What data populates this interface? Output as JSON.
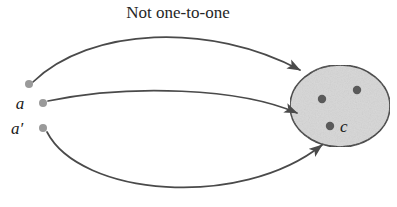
{
  "figure": {
    "title": "Not one-to-one",
    "width": 397,
    "height": 207,
    "background_color": "#ffffff"
  },
  "colors": {
    "title_text": "#262626",
    "label_text": "#1a1a1a",
    "curve_stroke": "#4a4a4a",
    "ellipse_stroke": "#333333",
    "ellipse_fill": "#d6d6d6",
    "domain_dot": "#9a9a9a",
    "codomain_dot": "#5a5a5a"
  },
  "domain_points": [
    {
      "id": "point-top",
      "label": "",
      "cx": 29,
      "cy": 84,
      "r": 4
    },
    {
      "id": "point-a",
      "label": "a",
      "cx": 43,
      "cy": 103,
      "r": 4,
      "label_x": 20,
      "label_y": 109
    },
    {
      "id": "point-a-prime",
      "label": "a′",
      "cx": 43,
      "cy": 128,
      "r": 4,
      "label_x": 15,
      "label_y": 134
    }
  ],
  "codomain": {
    "shape": "ellipse",
    "cx": 340,
    "cy": 106,
    "rx": 50,
    "ry": 41,
    "points": [
      {
        "id": "codomain-dot-upper-left",
        "label": "",
        "cx": 322,
        "cy": 99,
        "r": 4
      },
      {
        "id": "codomain-dot-upper-right",
        "label": "",
        "cx": 357,
        "cy": 90,
        "r": 4
      },
      {
        "id": "codomain-dot-c",
        "label": "c",
        "cx": 330,
        "cy": 126,
        "r": 4,
        "label_x": 339,
        "label_y": 132
      }
    ]
  },
  "arrows": [
    {
      "id": "arrow-top",
      "from": "point-top",
      "to": "codomain-dot-upper-left",
      "path": "M 33 82 C 90 27 210 22 300 70",
      "arrow_tip": "M 300 70 L 310 78"
    },
    {
      "id": "arrow-middle",
      "from": "point-a",
      "to": "codomain-dot-c",
      "path": "M 48 101 C 130 84 240 88 297 113",
      "arrow_tip": "M 297 113 L 308 119"
    },
    {
      "id": "arrow-bottom",
      "from": "point-a-prime",
      "to": "codomain-dot-c",
      "path": "M 47 132 C 80 196 240 210 322 145",
      "arrow_tip": "M 322 145 L 312 140"
    }
  ],
  "title_position": {
    "x": 178,
    "y": 18
  },
  "font_sizes": {
    "title": 17,
    "label": 17
  }
}
